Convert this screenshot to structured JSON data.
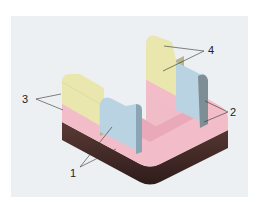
{
  "figure": {
    "background": "#edf0f2",
    "colors": {
      "yellow": "#e9e7ad",
      "blue": "#b9d3e2",
      "pink": "#f2bcc8",
      "dark": "#4a2f2c"
    },
    "labels": [
      {
        "id": "1",
        "text": "1"
      },
      {
        "id": "2",
        "text": "2"
      },
      {
        "id": "3",
        "text": "3"
      },
      {
        "id": "4",
        "text": "4"
      }
    ]
  }
}
